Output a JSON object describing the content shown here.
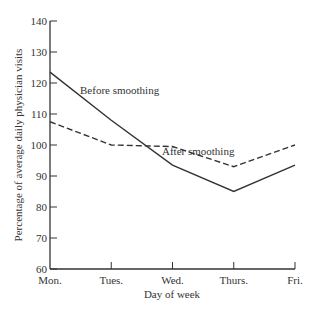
{
  "chart_data": {
    "type": "line",
    "title": "",
    "xlabel": "Day of week",
    "ylabel": "Percentage of average daily physician visits",
    "categories": [
      "Mon.",
      "Tues.",
      "Wed.",
      "Thurs.",
      "Fri."
    ],
    "ylim": [
      60,
      140
    ],
    "yticks": [
      60,
      70,
      80,
      90,
      100,
      110,
      120,
      130,
      140
    ],
    "grid": false,
    "legend": "none (inline annotations)",
    "series": [
      {
        "name": "Before smoothing",
        "style": "solid",
        "values": [
          123.5,
          108,
          93.5,
          85,
          93.5
        ]
      },
      {
        "name": "After smoothing",
        "style": "dashed",
        "values": [
          107.5,
          100,
          99.5,
          93,
          100
        ]
      }
    ],
    "annotations": [
      {
        "text": "Before smoothing",
        "near": "Tues."
      },
      {
        "text": "After smoothing",
        "near": "Wed."
      }
    ]
  },
  "colors": {
    "line": "#333333",
    "axis": "#333333",
    "background": "#ffffff"
  }
}
